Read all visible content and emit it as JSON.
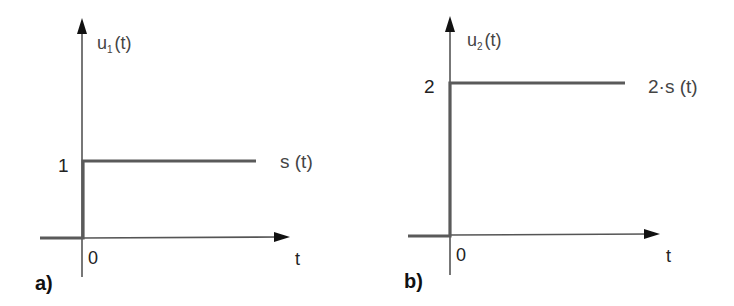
{
  "panels": [
    {
      "id": "a",
      "tag": "a)",
      "y_axis_label": {
        "base": "u",
        "sub": "1",
        "arg": "(t)"
      },
      "x_axis_label": "t",
      "origin_label": "0",
      "level_label": "1",
      "curve_label": "s (t)"
    },
    {
      "id": "b",
      "tag": "b)",
      "y_axis_label": {
        "base": "u",
        "sub": "2",
        "arg": "(t)"
      },
      "x_axis_label": "t",
      "origin_label": "0",
      "level_label": "2",
      "curve_label": "2·s (t)"
    }
  ],
  "colors": {
    "axis": "#555555",
    "step_line": "#5a5a5a",
    "arrow": "#111111",
    "text": "#444444"
  }
}
